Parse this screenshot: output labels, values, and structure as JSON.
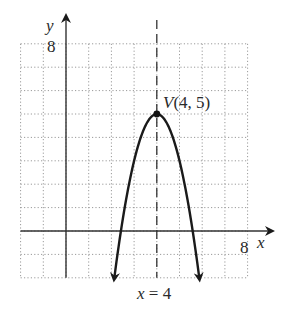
{
  "chart_data": {
    "type": "line",
    "title": "",
    "xlabel": "x",
    "ylabel": "y",
    "xlim": [
      -2,
      8
    ],
    "ylim": [
      -2,
      8
    ],
    "grid": true,
    "grid_style": "dotted",
    "x_tick_labels": [
      "8"
    ],
    "y_tick_labels": [
      "8"
    ],
    "series": [
      {
        "name": "parabola",
        "equation_approx": "y = -2(x - 4)^2 + 5",
        "x": [
          2.13,
          2.42,
          3,
          3.5,
          4,
          4.5,
          5,
          5.58,
          5.87
        ],
        "y": [
          -2,
          0,
          3,
          4.5,
          5,
          4.5,
          3,
          0,
          -2
        ],
        "ends": "arrows-down"
      }
    ],
    "annotations": [
      {
        "text": "V(4, 5)",
        "x": 4,
        "y": 5,
        "type": "vertex-point"
      },
      {
        "text": "x = 4",
        "type": "axis-of-symmetry",
        "style": "dashed-vertical",
        "x": 4
      }
    ],
    "colors": {
      "curve": "#1a1a1a",
      "grid": "#9a9a9a",
      "axis": "#333333"
    }
  },
  "labels": {
    "y_axis": "y",
    "x_axis": "x",
    "y_max": "8",
    "x_max": "8",
    "vertex": "V(4, 5)",
    "symmetry": "x = 4"
  }
}
